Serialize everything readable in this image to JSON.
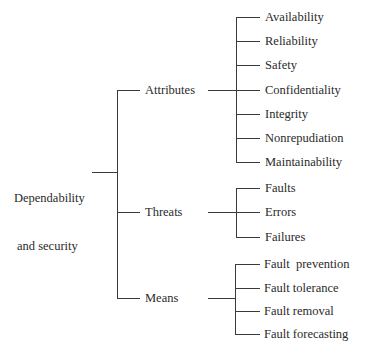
{
  "diagram": {
    "type": "tree",
    "root": {
      "label_line1": "Dependability",
      "label_line2": "and security"
    },
    "branches": [
      {
        "label": "Attributes",
        "children": [
          "Availability",
          "Reliability",
          "Safety",
          "Confidentiality",
          "Integrity",
          "Nonrepudiation",
          "Maintainability"
        ]
      },
      {
        "label": "Threats",
        "children": [
          "Faults",
          "Errors",
          "Failures"
        ]
      },
      {
        "label": "Means",
        "children": [
          "Fault  prevention",
          "Fault tolerance",
          "Fault removal",
          "Fault forecasting"
        ]
      }
    ],
    "colors": {
      "line": "#3a3a3a",
      "text": "#2a2a2a",
      "background": "#ffffff"
    }
  }
}
